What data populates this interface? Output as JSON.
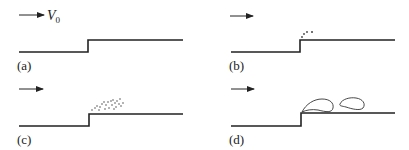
{
  "panels": [
    {
      "id": "a",
      "label": "(a)",
      "velocity_label": "V",
      "velocity_subscript": "0",
      "description": "Uniform flow over a forward-facing step"
    },
    {
      "id": "b",
      "label": "(b)",
      "description": "Small particles shed at step corner"
    },
    {
      "id": "c",
      "label": "(c)",
      "description": "Cloud of particles above step"
    },
    {
      "id": "d",
      "label": "(d)",
      "description": "Separation bubble and shed vortex"
    }
  ],
  "colors": {
    "line": "#222222",
    "background": "#ffffff"
  }
}
